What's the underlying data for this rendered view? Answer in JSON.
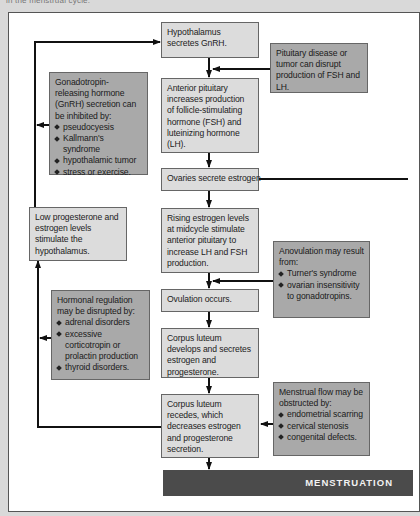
{
  "caption": "in the menstrual cycle.",
  "flow": {
    "hypothalamus": "Hypothalamus secretes GnRH.",
    "anterior_pituitary": "Anterior pituitary increases production of follicle-stimulating hormone (FSH) and luteinizing hormone (LH).",
    "ovaries": "Ovaries secrete estrogen",
    "rising_estrogen": "Rising estrogen levels at midcycle stimulate anterior pituitary to increase LH and FSH production.",
    "ovulation": "Ovulation occurs.",
    "corpus_develops": "Corpus luteum develops and secretes estrogen and progesterone.",
    "corpus_recedes": "Corpus luteum recedes, which decreases estrogen and progesterone secretion.",
    "menstruation": "MENSTRUATION"
  },
  "side_notes": {
    "pituitary_disease": "Pituitary disease or tumor can disrupt production of FSH and LH.",
    "gnrh_inhibited": {
      "intro": "Gonadotropin-releasing hormone (GnRH) secretion can be inhibited by:",
      "items": [
        "pseudocyesis",
        "Kallmann's syndrome",
        "hypothalamic tumor",
        "stress or exercise."
      ]
    },
    "low_progesterone": "Low progesterone and estrogen levels stimulate the hypothalamus.",
    "anovulation": {
      "intro": "Anovulation may result from:",
      "items": [
        "Turner's syndrome",
        "ovarian insensitivity to gonadotropins."
      ]
    },
    "hormonal_regulation": {
      "intro": "Hormonal regulation may be disrupted by:",
      "items": [
        "adrenal disorders",
        "excessive corticotropin or prolactin production",
        "thyroid disorders."
      ]
    },
    "menstrual_flow": {
      "intro": "Menstrual flow may be obstructed by:",
      "items": [
        "endometrial scarring",
        "cervical stenosis",
        "congenital defects."
      ]
    }
  },
  "colors": {
    "main_box": "#dcdcdc",
    "side_box": "#a9a9a9",
    "bar": "#4b4b4b",
    "line": "#111111"
  }
}
